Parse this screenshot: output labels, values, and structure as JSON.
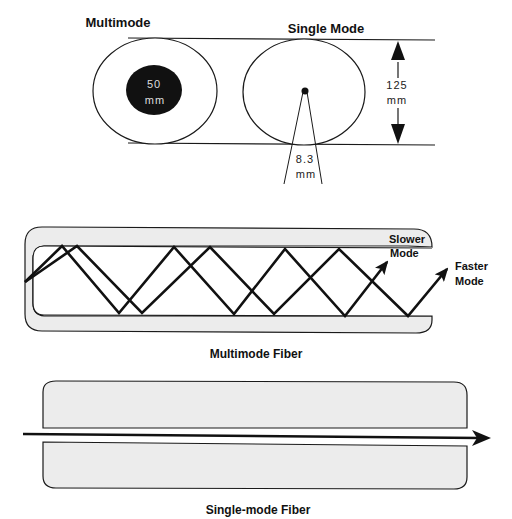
{
  "cross_section": {
    "multimode_title": "Multimode",
    "single_mode_title": "Single Mode",
    "multimode_core_value": "50",
    "multimode_core_unit": "mm",
    "cladding_value": "125",
    "cladding_unit": "mm",
    "single_core_value": "8.3",
    "single_core_unit": "mm"
  },
  "multimode_fiber": {
    "caption": "Multimode Fiber",
    "slower_label_1": "Slower",
    "slower_label_2": "Mode",
    "faster_label_1": "Faster",
    "faster_label_2": "Mode"
  },
  "single_mode_fiber": {
    "caption": "Single-mode Fiber"
  },
  "colors": {
    "stroke": "#1a1a1a",
    "cladding_fill": "#ececec",
    "core_fill": "#111111",
    "background": "#ffffff"
  }
}
